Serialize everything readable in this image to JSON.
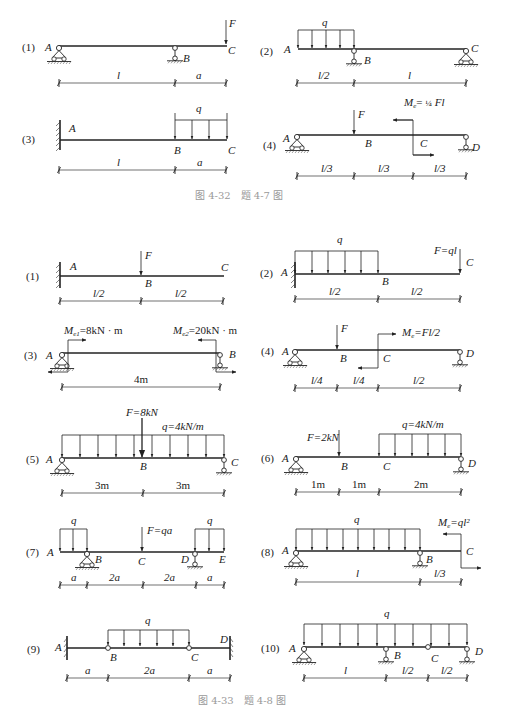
{
  "figure_4_32": {
    "caption": "图 4-32　题 4-7 图",
    "problems": [
      {
        "id": "(1)",
        "points": [
          "A",
          "B",
          "C"
        ],
        "load": "F",
        "dims": [
          "l",
          "a"
        ]
      },
      {
        "id": "(2)",
        "points": [
          "A",
          "B",
          "C"
        ],
        "load": "q",
        "dims": [
          "l/2",
          "l"
        ]
      },
      {
        "id": "(3)",
        "points": [
          "A",
          "B",
          "C"
        ],
        "load": "q",
        "dims": [
          "l",
          "a"
        ]
      },
      {
        "id": "(4)",
        "points": [
          "A",
          "B",
          "C",
          "D"
        ],
        "loads": [
          "F",
          "Me = 1/4 Fl"
        ],
        "dims": [
          "l/3",
          "l/3",
          "l/3"
        ]
      }
    ]
  },
  "figure_4_33": {
    "caption": "图 4-33　题 4-8 图",
    "problems": [
      {
        "id": "(1)",
        "points": [
          "A",
          "B",
          "C"
        ],
        "load": "F",
        "dims": [
          "l/2",
          "l/2"
        ]
      },
      {
        "id": "(2)",
        "points": [
          "A",
          "B",
          "C"
        ],
        "loads": [
          "q",
          "F=ql"
        ],
        "dims": [
          "l/2",
          "l/2"
        ]
      },
      {
        "id": "(3)",
        "points": [
          "A",
          "B"
        ],
        "loads": [
          "Me1=8kN·m",
          "Me2=20kN·m"
        ],
        "dims": [
          "4m"
        ]
      },
      {
        "id": "(4)",
        "points": [
          "A",
          "B",
          "C",
          "D"
        ],
        "loads": [
          "F",
          "Me=Fl/2"
        ],
        "dims": [
          "l/4",
          "l/4",
          "l/2"
        ]
      },
      {
        "id": "(5)",
        "points": [
          "A",
          "B",
          "C"
        ],
        "loads": [
          "F=8kN",
          "q=4kN/m"
        ],
        "dims": [
          "3m",
          "3m"
        ]
      },
      {
        "id": "(6)",
        "points": [
          "A",
          "B",
          "C",
          "D"
        ],
        "loads": [
          "F=2kN",
          "q=4kN/m"
        ],
        "dims": [
          "1m",
          "1m",
          "2m"
        ]
      },
      {
        "id": "(7)",
        "points": [
          "A",
          "B",
          "C",
          "D",
          "E"
        ],
        "loads": [
          "q",
          "F=qa",
          "q"
        ],
        "dims": [
          "a",
          "2a",
          "2a",
          "a"
        ]
      },
      {
        "id": "(8)",
        "points": [
          "A",
          "B",
          "C"
        ],
        "loads": [
          "q",
          "Me=ql²"
        ],
        "dims": [
          "l",
          "l/3"
        ]
      },
      {
        "id": "(9)",
        "points": [
          "A",
          "B",
          "C",
          "D"
        ],
        "load": "q",
        "dims": [
          "a",
          "2a",
          "a"
        ]
      },
      {
        "id": "(10)",
        "points": [
          "A",
          "B",
          "C",
          "D"
        ],
        "load": "q",
        "dims": [
          "l",
          "l/2",
          "l/2"
        ]
      }
    ]
  },
  "labels": {
    "p1": "(1)",
    "p2": "(2)",
    "p3": "(3)",
    "p4": "(4)",
    "p5": "(5)",
    "p6": "(6)",
    "p7": "(7)",
    "p8": "(8)",
    "p9": "(9)",
    "p10": "(10)",
    "A": "A",
    "B": "B",
    "C": "C",
    "D": "D",
    "E": "E",
    "F": "F",
    "q": "q",
    "l": "l",
    "a": "a",
    "a2": "2a",
    "l2": "l/2",
    "l3": "l/3",
    "l4": "l/4",
    "me_quarter": "Fl",
    "me_prefix": "M",
    "me_sub": "e",
    "me1": "=8kN · m",
    "me2": "=20kN · m",
    "me4": "=Fl/2",
    "me8": "=ql²",
    "F_ql": "F=ql",
    "F_8": "F=8kN",
    "q_4": "q=4kN/m",
    "F_2": "F=2kN",
    "F_qa": "F=qa",
    "m4": "4m",
    "m3": "3m",
    "m1": "1m",
    "m2": "2m",
    "cap1": "图 4-32　题 4-7 图",
    "cap2": "图 4-33　题 4-8 图"
  }
}
